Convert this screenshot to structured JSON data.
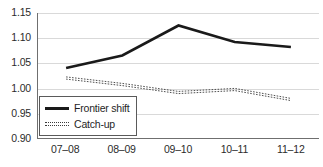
{
  "chart_data": {
    "type": "line",
    "title": "",
    "subtitle": "",
    "xlabel": "",
    "ylabel": "",
    "categories": [
      "07–08",
      "08–09",
      "09–10",
      "10–11",
      "11–12"
    ],
    "series": [
      {
        "name": "Frontier shift",
        "style": "solid",
        "color": "#1a1a1a",
        "values": [
          1.04,
          1.065,
          1.125,
          1.092,
          1.082
        ]
      },
      {
        "name": "Catch-up",
        "style": "dotted",
        "color": "#3a3a3a",
        "values": [
          1.02,
          1.007,
          0.991,
          0.997,
          0.977
        ]
      }
    ],
    "ylim": [
      0.9,
      1.15
    ],
    "yticks": [
      "1.15",
      "1.10",
      "1.05",
      "1.00",
      "0.95",
      "0.90"
    ],
    "ytick_values": [
      1.15,
      1.1,
      1.05,
      1.0,
      0.95,
      0.9
    ],
    "grid": true,
    "grid_axis": "y",
    "legend_position": "lower-left-inside",
    "background_color": "#ffffff",
    "axis_color": "#6f6f6f",
    "grid_color": "#d9d9d9"
  },
  "legend": {
    "entries": [
      {
        "label": "Frontier shift",
        "swatch": "solid-line-swatch"
      },
      {
        "label": "Catch-up",
        "swatch": "dotted-line-swatch"
      }
    ]
  }
}
